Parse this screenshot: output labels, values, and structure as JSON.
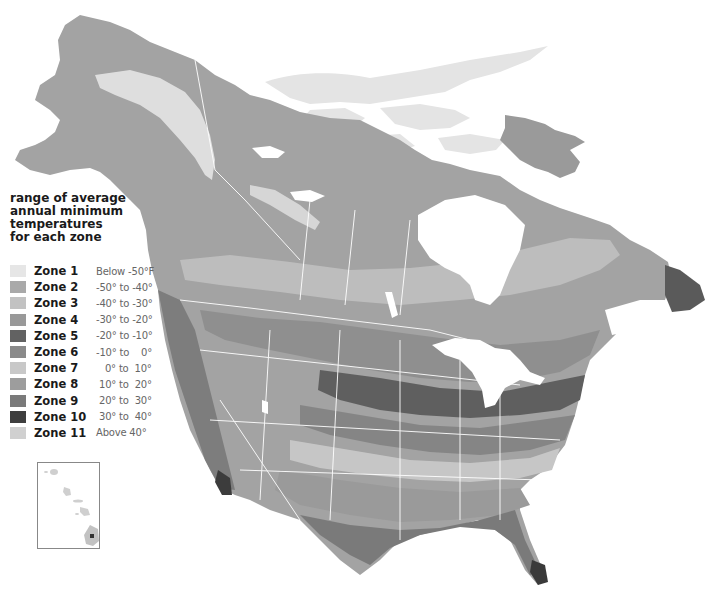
{
  "map": {
    "title": "Plant Hardiness Zone Map of North America",
    "region": "North America (Canada, United States, Mexico)",
    "inset": "Hawaii",
    "style": "grayscale",
    "features": {
      "lakes": [
        "Great Bear Lake",
        "Great Slave Lake",
        "Lake Winnipeg",
        "Great Lakes",
        "Great Salt Lake"
      ],
      "bays": [
        "Hudson Bay",
        "Gulf of Mexico"
      ]
    }
  },
  "legend": {
    "title": "range of average annual minimum temperatures for each zone",
    "title_lines": [
      "range of average",
      "annual minimum",
      "temperatures",
      "for each zone"
    ],
    "zones": [
      {
        "name": "Zone 1",
        "range": "Below -50°F",
        "color": "#e6e6e6"
      },
      {
        "name": "Zone 2",
        "range": "-50° to -40°",
        "color": "#a9a9a9"
      },
      {
        "name": "Zone 3",
        "range": "-40° to -30°",
        "color": "#c2c2c2"
      },
      {
        "name": "Zone 4",
        "range": "-30° to -20°",
        "color": "#999999"
      },
      {
        "name": "Zone 5",
        "range": "-20° to -10°",
        "color": "#626262"
      },
      {
        "name": "Zone 6",
        "range": "-10° to    0°",
        "color": "#8a8a8a"
      },
      {
        "name": "Zone 7",
        "range": "   0° to  10°",
        "color": "#c8c8c8"
      },
      {
        "name": "Zone 8",
        "range": " 10° to  20°",
        "color": "#9d9d9d"
      },
      {
        "name": "Zone 9",
        "range": " 20° to  30°",
        "color": "#7a7a7a"
      },
      {
        "name": "Zone 10",
        "range": " 30° to  40°",
        "color": "#3e3e3e"
      },
      {
        "name": "Zone 11",
        "range": "Above 40°",
        "color": "#d0d0d0"
      }
    ]
  }
}
